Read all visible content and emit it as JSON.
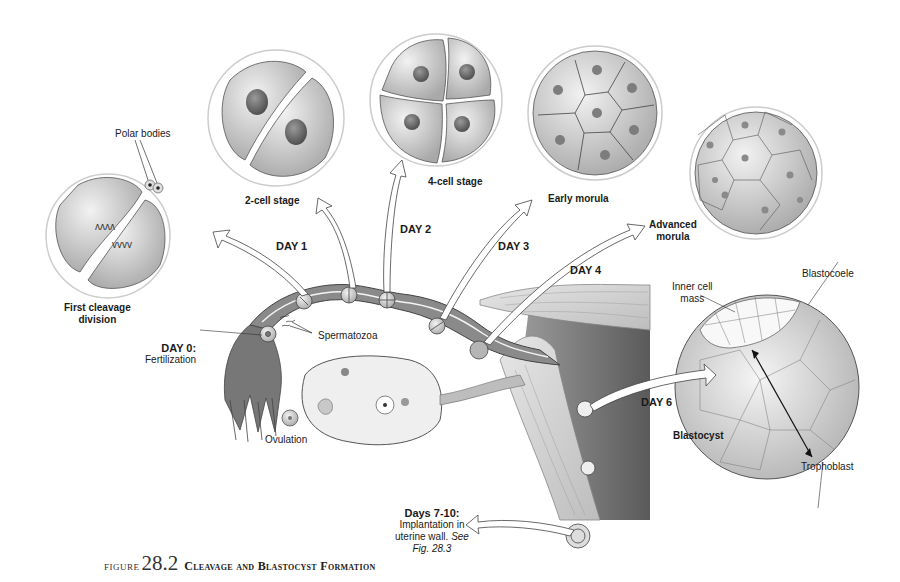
{
  "figure": {
    "label": "FIGURE",
    "number": "28.2",
    "title": "Cleavage and Blastocyst Formation"
  },
  "stages": {
    "first_cleavage": {
      "line1": "First cleavage",
      "line2": "division"
    },
    "polar_bodies": "Polar bodies",
    "two_cell": "2-cell stage",
    "four_cell": "4-cell stage",
    "early_morula": "Early morula",
    "advanced_morula": {
      "line1": "Advanced",
      "line2": "morula"
    },
    "blastocyst": "Blastocyst",
    "inner_cell_mass": {
      "line1": "Inner cell",
      "line2": "mass"
    },
    "blastocoele": "Blastocoele",
    "trophoblast": "Trophoblast"
  },
  "days": {
    "day0": {
      "label": "DAY 0:",
      "desc": "Fertilization"
    },
    "day1": "DAY 1",
    "day2": "DAY 2",
    "day3": "DAY 3",
    "day4": "DAY 4",
    "day6": "DAY 6",
    "days7_10": {
      "label": "Days 7-10:",
      "line1": "Implantation in",
      "line2": "uterine wall.",
      "see": "See",
      "ref": "Fig. 28.3"
    }
  },
  "anatomy": {
    "spermatozoa": "Spermatozoa",
    "ovulation": "Ovulation"
  },
  "colors": {
    "cell_fill": "#d9d9d9",
    "cell_stroke": "#555555",
    "tube_lumen": "#8a8a8a",
    "uterus_dark": "#6e6e6e",
    "arrow_stroke": "#444444"
  }
}
